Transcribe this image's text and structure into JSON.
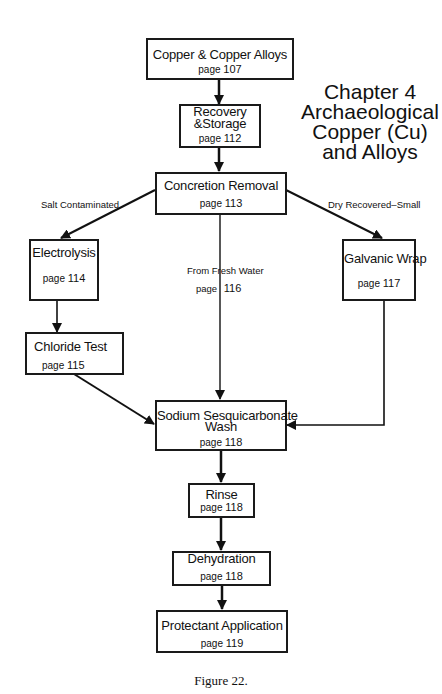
{
  "chapter_title": {
    "line1": "Chapter 4",
    "line2": "Archaeological",
    "line3": "Copper (Cu)",
    "line4": "and Alloys"
  },
  "nodes": {
    "copper_alloys": {
      "title": "Copper & Copper Alloys",
      "page_word": "page",
      "page": "107"
    },
    "recovery_storage": {
      "title_line1": "Recovery",
      "title_line2": "&Storage",
      "page_word": "page",
      "page": "112"
    },
    "concretion_removal": {
      "title": "Concretion Removal",
      "page_word": "page",
      "page": "113"
    },
    "electrolysis": {
      "title": "Electrolysis",
      "page_word": "page",
      "page": "114"
    },
    "galvanic_wrap": {
      "title": "Galvanic Wrap",
      "page_word": "page",
      "page": "117"
    },
    "chloride_test": {
      "title": "Chloride Test",
      "page_word": "page",
      "page": "115"
    },
    "sodium_wash": {
      "title_line1": "Sodium Sesquicarbonate",
      "title_line2": "Wash",
      "page_word": "page",
      "page": "118"
    },
    "rinse": {
      "title": "Rinse",
      "page_word": "page",
      "page": "118"
    },
    "dehydration": {
      "title": "Dehydration",
      "page_word": "page",
      "page": "118"
    },
    "protectant": {
      "title": "Protectant Application",
      "page_word": "page",
      "page": "119"
    }
  },
  "edge_labels": {
    "salt": "Salt Contaminated",
    "dry": "Dry  Recovered–Small",
    "fresh": "From Fresh Water",
    "fresh_page_word": "page",
    "fresh_page": "116"
  },
  "caption": "Figure 22."
}
